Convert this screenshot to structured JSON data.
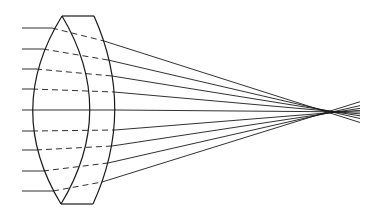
{
  "diagram": {
    "title": "",
    "colors": {
      "line": "#1a1a1a",
      "background": "#ffffff"
    },
    "ray_count": 9,
    "optical_axis_index": 4,
    "labels": []
  }
}
